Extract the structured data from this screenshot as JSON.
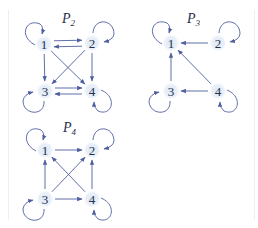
{
  "diagram": {
    "colors": {
      "edge": "#4f5f9e",
      "node_fill": "#e6eef8",
      "text": "#2a2f4a"
    },
    "graphs": [
      {
        "id": "P2",
        "title_main": "P",
        "title_sub": "2",
        "title_pos": [
          62,
          23
        ],
        "nodes": [
          {
            "id": "1",
            "label": "1",
            "x": 44,
            "y": 44,
            "loop": "top-left"
          },
          {
            "id": "2",
            "label": "2",
            "x": 92,
            "y": 43,
            "loop": "top-right"
          },
          {
            "id": "3",
            "label": "3",
            "x": 45,
            "y": 91,
            "loop": "bottom-left"
          },
          {
            "id": "4",
            "label": "4",
            "x": 92,
            "y": 91,
            "loop": "bottom-right"
          }
        ],
        "edges": [
          {
            "from": "1",
            "to": "2",
            "offset": -3
          },
          {
            "from": "2",
            "to": "1",
            "offset": -3
          },
          {
            "from": "1",
            "to": "3",
            "offset": 0
          },
          {
            "from": "2",
            "to": "4",
            "offset": 0
          },
          {
            "from": "1",
            "to": "4",
            "offset": 0
          },
          {
            "from": "2",
            "to": "3",
            "offset": 0
          },
          {
            "from": "3",
            "to": "4",
            "offset": -3
          },
          {
            "from": "4",
            "to": "3",
            "offset": -3
          }
        ]
      },
      {
        "id": "P3",
        "title_main": "P",
        "title_sub": "3",
        "title_pos": [
          187,
          23
        ],
        "nodes": [
          {
            "id": "1",
            "label": "1",
            "x": 171,
            "y": 43,
            "loop": "top-left"
          },
          {
            "id": "2",
            "label": "2",
            "x": 218,
            "y": 43,
            "loop": "top-right"
          },
          {
            "id": "3",
            "label": "3",
            "x": 171,
            "y": 91,
            "loop": "bottom-left"
          },
          {
            "id": "4",
            "label": "4",
            "x": 218,
            "y": 91,
            "loop": "bottom-right"
          }
        ],
        "edges": [
          {
            "from": "2",
            "to": "1",
            "offset": 0
          },
          {
            "from": "3",
            "to": "1",
            "offset": 0
          },
          {
            "from": "4",
            "to": "1",
            "offset": 0
          },
          {
            "from": "4",
            "to": "3",
            "offset": 0
          }
        ]
      },
      {
        "id": "P4",
        "title_main": "P",
        "title_sub": "4",
        "title_pos": [
          63,
          132
        ],
        "nodes": [
          {
            "id": "1",
            "label": "1",
            "x": 45,
            "y": 150,
            "loop": "top-left"
          },
          {
            "id": "2",
            "label": "2",
            "x": 92,
            "y": 150,
            "loop": "top-right"
          },
          {
            "id": "3",
            "label": "3",
            "x": 45,
            "y": 199,
            "loop": "bottom-left"
          },
          {
            "id": "4",
            "label": "4",
            "x": 92,
            "y": 199,
            "loop": "bottom-right"
          }
        ],
        "edges": [
          {
            "from": "1",
            "to": "2",
            "offset": 0
          },
          {
            "from": "3",
            "to": "1",
            "offset": 0
          },
          {
            "from": "4",
            "to": "2",
            "offset": 0
          },
          {
            "from": "3",
            "to": "2",
            "offset": 0
          },
          {
            "from": "4",
            "to": "1",
            "offset": 0
          },
          {
            "from": "3",
            "to": "4",
            "offset": 0
          }
        ]
      }
    ]
  }
}
